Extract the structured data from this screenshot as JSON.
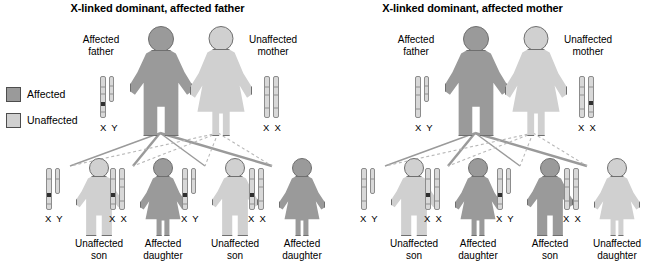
{
  "legend": {
    "items": [
      {
        "label": "Affected",
        "color": "#9a9a9a",
        "icon": "affected-swatch"
      },
      {
        "label": "Unaffected",
        "color": "#d0d0d0",
        "icon": "unaffected-swatch"
      }
    ]
  },
  "panels": [
    {
      "id": "affected-father",
      "title": "X-linked dominant, affected father",
      "father": {
        "label_line1": "Affected",
        "label_line2": "father",
        "status": "affected",
        "karyotype": "X Y",
        "x_mutant": true,
        "y_mutant": false
      },
      "mother": {
        "label_line1": "Unaffected",
        "label_line2": "mother",
        "status": "unaffected",
        "karyotype": "X X",
        "x1_mutant": false,
        "x2_mutant": false
      },
      "children": [
        {
          "label_line1": "Unaffected",
          "label_line2": "son",
          "sex": "male",
          "status": "unaffected",
          "karyotype": "X Y",
          "mutant": true
        },
        {
          "label_line1": "Affected",
          "label_line2": "daughter",
          "sex": "female",
          "status": "affected",
          "karyotype": "X X",
          "mutant": true
        },
        {
          "label_line1": "Unaffected",
          "label_line2": "son",
          "sex": "male",
          "status": "unaffected",
          "karyotype": "X Y",
          "mutant": true
        },
        {
          "label_line1": "Affected",
          "label_line2": "daughter",
          "sex": "female",
          "status": "affected",
          "karyotype": "X X",
          "mutant": true
        }
      ]
    },
    {
      "id": "affected-mother",
      "title": "X-linked dominant, affected mother",
      "father": {
        "label_line1": "Affected",
        "label_line2": "father",
        "status": "affected",
        "karyotype": "X Y",
        "x_mutant": false,
        "y_mutant": false
      },
      "mother": {
        "label_line1": "Unaffected",
        "label_line2": "mother",
        "status": "unaffected",
        "karyotype": "X X",
        "x1_mutant": false,
        "x2_mutant": true
      },
      "children": [
        {
          "label_line1": "Unaffected",
          "label_line2": "son",
          "sex": "male",
          "status": "unaffected",
          "karyotype": "X Y",
          "mutant": false
        },
        {
          "label_line1": "Affected",
          "label_line2": "daughter",
          "sex": "female",
          "status": "affected",
          "karyotype": "X X",
          "mutant": true
        },
        {
          "label_line1": "Affected",
          "label_line2": "son",
          "sex": "male",
          "status": "affected",
          "karyotype": "X Y",
          "mutant": true
        },
        {
          "label_line1": "Unaffected",
          "label_line2": "daughter",
          "sex": "female",
          "status": "unaffected",
          "karyotype": "X X",
          "mutant": false
        }
      ]
    }
  ]
}
